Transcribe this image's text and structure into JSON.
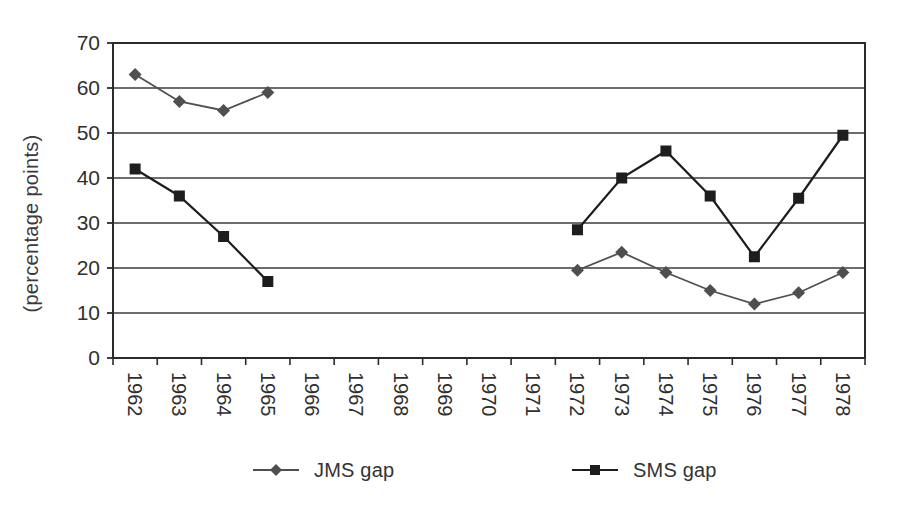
{
  "figure": {
    "background": "#ffffff",
    "text_color": "#2f2f2f",
    "frame_color": "#2b2b2b",
    "grid_color": "#3d3d3d"
  },
  "chart_data": {
    "type": "line",
    "title": "",
    "xlabel": "",
    "ylabel": "(percentage points)",
    "ylim": [
      0,
      70
    ],
    "yticks": [
      0,
      10,
      20,
      30,
      40,
      50,
      60,
      70
    ],
    "grid": "horizontal",
    "legend_position": "bottom",
    "categories": [
      "1962",
      "1963",
      "1964",
      "1965",
      "1966",
      "1967",
      "1968",
      "1969",
      "1970",
      "1971",
      "1972",
      "1973",
      "1974",
      "1975",
      "1976",
      "1977",
      "1978"
    ],
    "series": [
      {
        "name": "JMS gap",
        "marker": "diamond",
        "color": "#4f4f4f",
        "values": [
          63,
          57,
          55,
          59,
          null,
          null,
          null,
          null,
          null,
          null,
          19.5,
          23.5,
          19,
          15,
          12,
          14.5,
          19
        ]
      },
      {
        "name": "SMS gap",
        "marker": "square",
        "color": "#1d1d1d",
        "values": [
          42,
          36,
          27,
          17,
          null,
          null,
          null,
          null,
          null,
          null,
          28.5,
          40,
          46,
          36,
          22.5,
          35.5,
          49.5
        ]
      }
    ]
  }
}
